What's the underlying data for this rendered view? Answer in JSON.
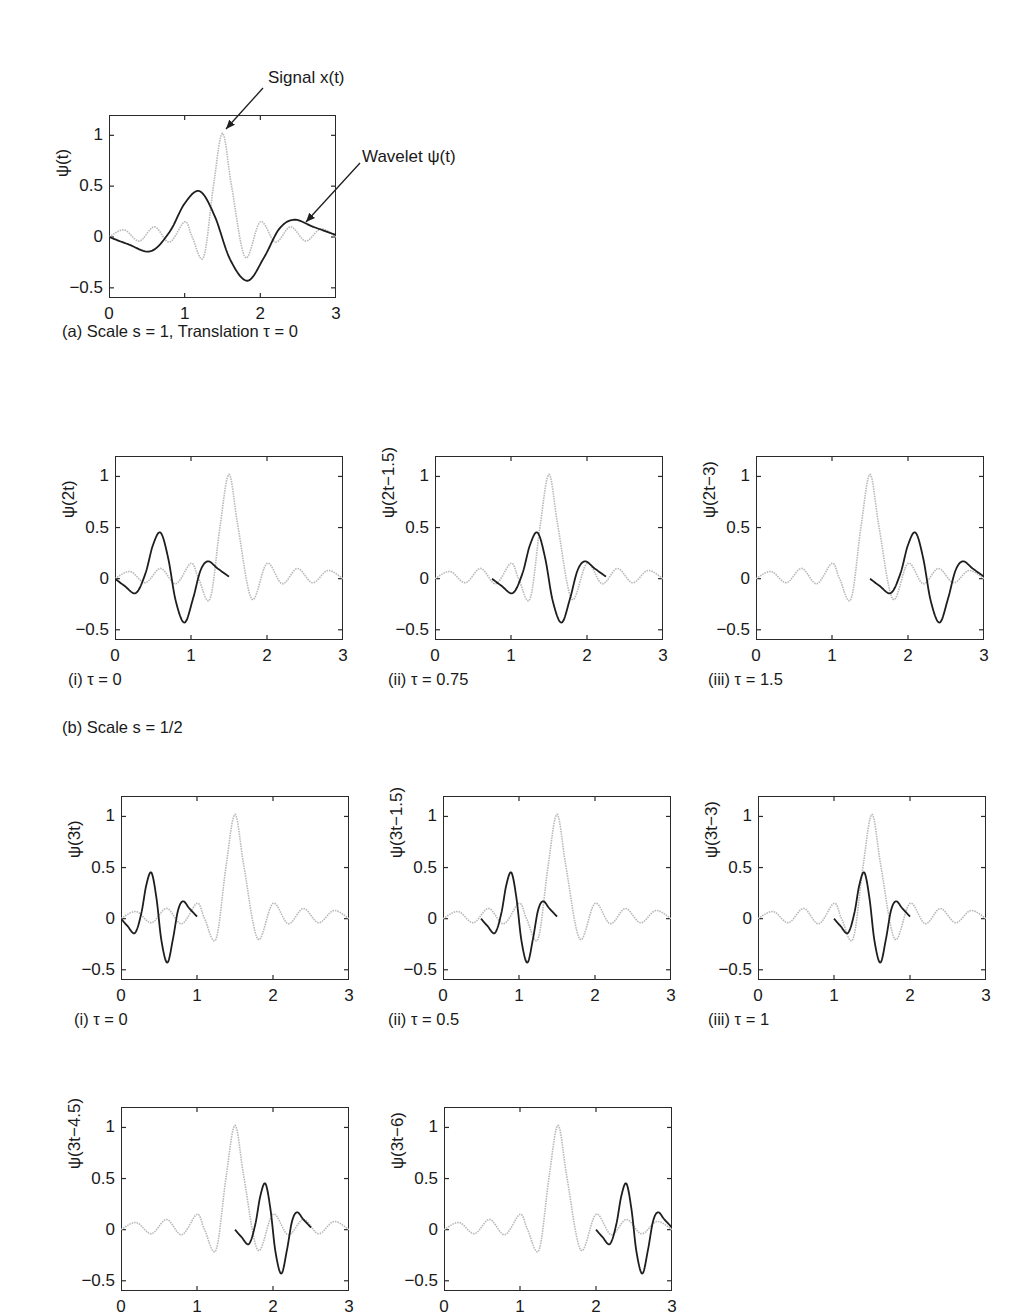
{
  "figure": {
    "caption_a": "(a) Scale s = 1, Translation τ = 0",
    "caption_b": "(b) Scale s = 1/2",
    "annotation_signal": "Signal x(t)",
    "annotation_wavelet": "Wavelet ψ(t)"
  },
  "colors": {
    "wavelet": "#1e1e1e",
    "signal": "#b8b8b8",
    "frame": "#2a2a2a"
  },
  "axis": {
    "xticks": [
      "0",
      "1",
      "2",
      "3"
    ],
    "yticks": [
      "1",
      "0.5",
      "0",
      "−0.5"
    ],
    "xlim": [
      0,
      3
    ],
    "ylim": [
      -0.6,
      1.2
    ]
  },
  "chart_data": {
    "type": "line",
    "xlabel": "t",
    "ylim": [
      -0.6,
      1.2
    ],
    "xlim": [
      0,
      3
    ],
    "grid": false,
    "base_wavelet_points": {
      "t": [
        0,
        0.25,
        0.55,
        0.8,
        1.0,
        1.2,
        1.4,
        1.6,
        1.83,
        2.05,
        2.25,
        2.45,
        2.7,
        3.0
      ],
      "v": [
        0,
        -0.07,
        -0.14,
        0.05,
        0.33,
        0.45,
        0.2,
        -0.22,
        -0.43,
        -0.2,
        0.08,
        0.17,
        0.1,
        0.02
      ]
    },
    "signal_points": {
      "t": [
        0,
        0.2,
        0.4,
        0.6,
        0.8,
        1.0,
        1.1,
        1.25,
        1.38,
        1.5,
        1.62,
        1.8,
        2.0,
        2.2,
        2.4,
        2.6,
        2.8,
        3.0
      ],
      "v": [
        0,
        0.07,
        -0.04,
        0.1,
        -0.05,
        0.15,
        0,
        -0.2,
        0.5,
        1.02,
        0.5,
        -0.2,
        0.15,
        -0.05,
        0.1,
        -0.04,
        0.08,
        0
      ]
    },
    "panels": [
      {
        "id": "a",
        "ylabel": "ψ(t)",
        "scale": 1,
        "tau": 0,
        "caption": "(a) Scale s = 1, Translation τ = 0"
      },
      {
        "id": "b-i",
        "ylabel": "ψ(2t)",
        "scale": 0.5,
        "tau": 0,
        "caption": "(i) τ = 0"
      },
      {
        "id": "b-ii",
        "ylabel": "ψ(2t−1.5)",
        "scale": 0.5,
        "tau": 0.75,
        "caption": "(ii) τ = 0.75"
      },
      {
        "id": "b-iii",
        "ylabel": "ψ(2t−3)",
        "scale": 0.5,
        "tau": 1.5,
        "caption": "(iii) τ = 1.5"
      },
      {
        "id": "c-i",
        "ylabel": "ψ(3t)",
        "scale": 0.3333,
        "tau": 0,
        "caption": "(i) τ = 0"
      },
      {
        "id": "c-ii",
        "ylabel": "ψ(3t−1.5)",
        "scale": 0.3333,
        "tau": 0.5,
        "caption": "(ii) τ = 0.5"
      },
      {
        "id": "c-iii",
        "ylabel": "ψ(3t−3)",
        "scale": 0.3333,
        "tau": 1,
        "caption": "(iii) τ = 1"
      },
      {
        "id": "c-iv",
        "ylabel": "ψ(3t−4.5)",
        "scale": 0.3333,
        "tau": 1.5,
        "caption": ""
      },
      {
        "id": "c-v",
        "ylabel": "ψ(3t−6)",
        "scale": 0.3333,
        "tau": 2,
        "caption": ""
      }
    ]
  },
  "layout": {
    "panels": [
      {
        "x": 109,
        "y": 115,
        "w": 227,
        "h": 183,
        "cap_x": 62,
        "cap_y": 330
      },
      {
        "x": 115,
        "y": 456,
        "w": 228,
        "h": 184,
        "cap_x": 68,
        "cap_y": 678
      },
      {
        "x": 435,
        "y": 456,
        "w": 228,
        "h": 184,
        "cap_x": 388,
        "cap_y": 678
      },
      {
        "x": 756,
        "y": 456,
        "w": 228,
        "h": 184,
        "cap_x": 708,
        "cap_y": 678
      },
      {
        "x": 121,
        "y": 796,
        "w": 228,
        "h": 184,
        "cap_x": 74,
        "cap_y": 1018
      },
      {
        "x": 443,
        "y": 796,
        "w": 228,
        "h": 184,
        "cap_x": 388,
        "cap_y": 1018
      },
      {
        "x": 758,
        "y": 796,
        "w": 228,
        "h": 184,
        "cap_x": 708,
        "cap_y": 1018
      },
      {
        "x": 121,
        "y": 1107,
        "w": 228,
        "h": 184,
        "cap_x": 74,
        "cap_y": 1330
      },
      {
        "x": 444,
        "y": 1107,
        "w": 228,
        "h": 184,
        "cap_x": 396,
        "cap_y": 1330
      }
    ],
    "caption_b_pos": {
      "x": 62,
      "y": 718
    }
  }
}
